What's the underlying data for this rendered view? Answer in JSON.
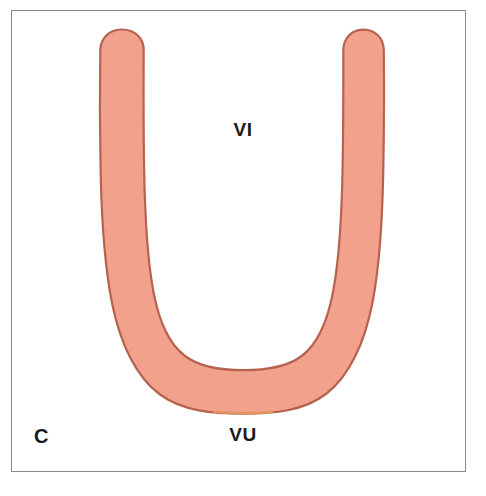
{
  "figure": {
    "panel_letter": "C",
    "background_color": "#ffffff",
    "frame_color": "#8a8a8a",
    "labels": [
      {
        "id": "vi",
        "text": "VI",
        "position": "inside-u-opening",
        "color": "#1a1a1a"
      },
      {
        "id": "vu",
        "text": "VU",
        "position": "below-u-base",
        "color": "#1a1a1a"
      }
    ],
    "structure": {
      "name": "u-shaped-structure",
      "shape": "horseshoe",
      "fill_color": "#F2A18D",
      "stroke_color": "#B5634F",
      "accent_edge_color": "#E09060"
    }
  }
}
